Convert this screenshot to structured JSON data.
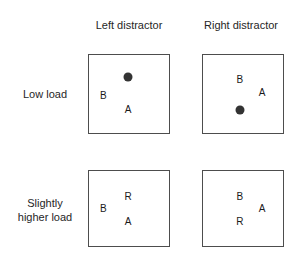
{
  "figure": {
    "name": "attention-load-distractor-diagram",
    "column_headers": [
      "Left distractor",
      "Right distractor"
    ],
    "row_labels": [
      "Low load",
      "Slightly\nhigher load"
    ],
    "cells": [
      {
        "row": "Low load",
        "column": "Left distractor",
        "items": [
          {
            "kind": "dot",
            "label": "",
            "x": 49,
            "y": 28
          },
          {
            "kind": "letter",
            "label": "B",
            "x": 18,
            "y": 52
          },
          {
            "kind": "letter",
            "label": "A",
            "x": 49,
            "y": 70
          }
        ]
      },
      {
        "row": "Low load",
        "column": "Right distractor",
        "items": [
          {
            "kind": "letter",
            "label": "B",
            "x": 46,
            "y": 32
          },
          {
            "kind": "letter",
            "label": "A",
            "x": 74,
            "y": 49
          },
          {
            "kind": "dot",
            "label": "",
            "x": 46,
            "y": 70
          }
        ]
      },
      {
        "row": "Slightly higher load",
        "column": "Left distractor",
        "items": [
          {
            "kind": "letter",
            "label": "R",
            "x": 49,
            "y": 35
          },
          {
            "kind": "letter",
            "label": "B",
            "x": 18,
            "y": 50
          },
          {
            "kind": "letter",
            "label": "A",
            "x": 49,
            "y": 68
          }
        ]
      },
      {
        "row": "Slightly higher load",
        "column": "Right distractor",
        "items": [
          {
            "kind": "letter",
            "label": "B",
            "x": 46,
            "y": 34
          },
          {
            "kind": "letter",
            "label": "A",
            "x": 74,
            "y": 50
          },
          {
            "kind": "letter",
            "label": "R",
            "x": 46,
            "y": 68
          }
        ]
      }
    ],
    "colors": {
      "box_border": "#4d4d4d",
      "dot_fill": "#333333",
      "text": "#1a1a1a",
      "background": "#ffffff"
    }
  }
}
